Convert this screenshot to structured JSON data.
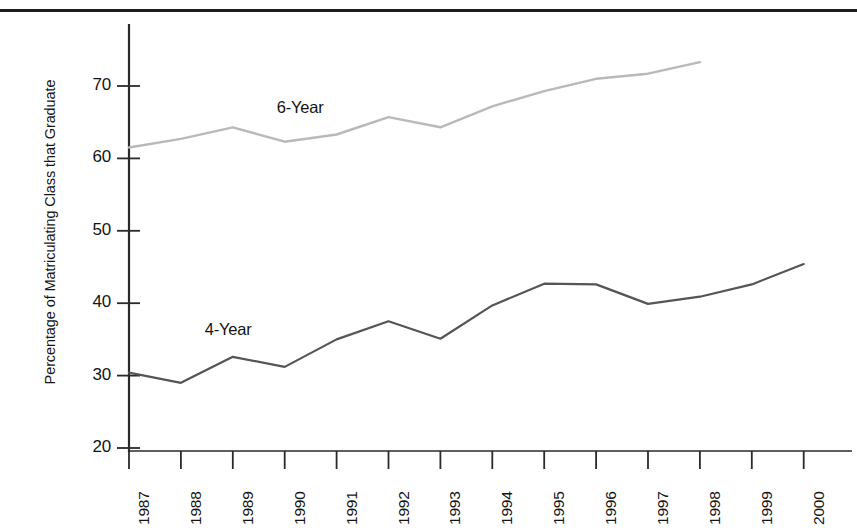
{
  "chart_data": {
    "type": "line",
    "title": "",
    "subtitle": "",
    "xlabel": "",
    "ylabel": "Percentage of Matriculating Class that Graduate",
    "x": [
      1987,
      1988,
      1989,
      1990,
      1991,
      1992,
      1993,
      1994,
      1995,
      1996,
      1997,
      1998,
      1999,
      2000
    ],
    "categories": [
      "1987",
      "1988",
      "1989",
      "1990",
      "1991",
      "1992",
      "1993",
      "1994",
      "1995",
      "1996",
      "1997",
      "1998",
      "1999",
      "2000"
    ],
    "xlim": [
      1987,
      2000
    ],
    "ylim": [
      18,
      76
    ],
    "yticks": [
      20,
      30,
      40,
      50,
      60,
      70
    ],
    "ytick_labels": [
      "20",
      "30",
      "40",
      "50",
      "60",
      "70"
    ],
    "grid": false,
    "legend_position": "inline-annotation",
    "series": [
      {
        "name": "6-Year",
        "color": "#b9b9b9",
        "label_x": 1990.0,
        "label_y": 67.0,
        "x": [
          1987,
          1988,
          1989,
          1990,
          1991,
          1992,
          1993,
          1994,
          1995,
          1996,
          1997,
          1998
        ],
        "values": [
          61.5,
          62.7,
          64.3,
          62.3,
          63.3,
          65.7,
          64.3,
          67.2,
          69.3,
          71.0,
          71.7,
          73.3
        ]
      },
      {
        "name": "4-Year",
        "color": "#555555",
        "label_x": 1989.0,
        "label_y": 36.3,
        "x": [
          1987,
          1988,
          1989,
          1990,
          1991,
          1992,
          1993,
          1994,
          1995,
          1996,
          1997,
          1998,
          1999,
          2000
        ],
        "values": [
          30.4,
          29.0,
          32.6,
          31.2,
          35.0,
          37.5,
          35.1,
          39.7,
          42.7,
          42.6,
          39.9,
          40.9,
          42.6,
          45.4
        ]
      }
    ]
  },
  "axis": {
    "y_title": "Percentage of Matriculating Class that Graduate",
    "y_tick_labels": [
      "70",
      "60",
      "50",
      "40",
      "30",
      "20"
    ],
    "x_tick_labels": [
      "1987",
      "1988",
      "1989",
      "1990",
      "1991",
      "1992",
      "1993",
      "1994",
      "1995",
      "1996",
      "1997",
      "1998",
      "1999",
      "2000"
    ]
  },
  "annotations": {
    "six_year_label": "6-Year",
    "four_year_label": "4-Year"
  },
  "colors": {
    "six_year_line": "#b9b9b9",
    "four_year_line": "#555555",
    "axis": "#2a2a2a",
    "rule": "#1d1d1d",
    "background": "#ffffff"
  }
}
